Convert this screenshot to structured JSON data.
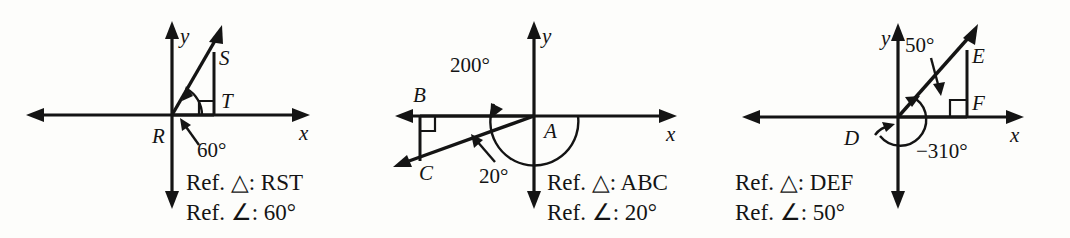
{
  "figure": {
    "background_color": "#fdfdfb",
    "ink_color": "#141414"
  },
  "panels": [
    {
      "id": "panel-rst",
      "axis_labels": {
        "x": "x",
        "y": "y"
      },
      "vertices": [
        {
          "name": "R",
          "label": "R"
        },
        {
          "name": "S",
          "label": "S"
        },
        {
          "name": "T",
          "label": "T"
        }
      ],
      "angle_label": "60°",
      "caption": {
        "triangle_prefix": "Ref. ",
        "triangle_symbol": "△",
        "triangle_value": ": RST",
        "angle_prefix": "Ref. ",
        "angle_symbol": "∠",
        "angle_value": ": 60°",
        "line1": "Ref. △: RST",
        "line2": "Ref. ∠: 60°"
      }
    },
    {
      "id": "panel-abc",
      "axis_labels": {
        "x": "x",
        "y": "y"
      },
      "vertices": [
        {
          "name": "A",
          "label": "A"
        },
        {
          "name": "B",
          "label": "B"
        },
        {
          "name": "C",
          "label": "C"
        }
      ],
      "rotation_label": "200°",
      "angle_label": "20°",
      "caption": {
        "triangle_prefix": "Ref. ",
        "triangle_symbol": "△",
        "triangle_value": ": ABC",
        "angle_prefix": "Ref. ",
        "angle_symbol": "∠",
        "angle_value": ": 20°",
        "line1": "Ref. △: ABC",
        "line2": "Ref. ∠: 20°"
      }
    },
    {
      "id": "panel-def",
      "axis_labels": {
        "x": "x",
        "y": "y"
      },
      "vertices": [
        {
          "name": "D",
          "label": "D"
        },
        {
          "name": "E",
          "label": "E"
        },
        {
          "name": "F",
          "label": "F"
        }
      ],
      "rotation_label": "−310°",
      "angle_label": "50°",
      "caption": {
        "triangle_prefix": "Ref. ",
        "triangle_symbol": "△",
        "triangle_value": ": DEF",
        "angle_prefix": "Ref. ",
        "angle_symbol": "∠",
        "angle_value": ": 50°",
        "line1": "Ref. △: DEF",
        "line2": "Ref. ∠: 50°"
      }
    }
  ]
}
